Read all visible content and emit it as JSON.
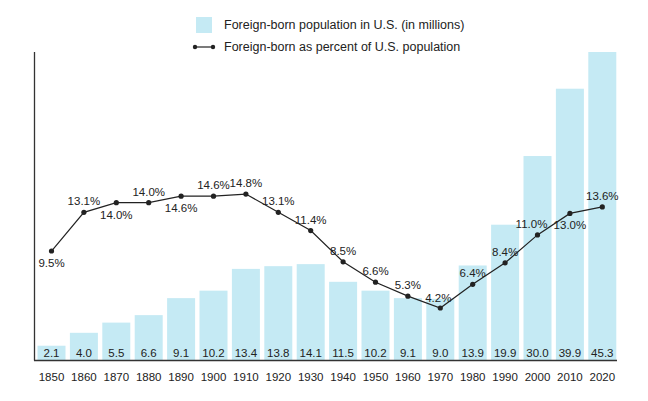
{
  "chart_data": {
    "type": "bar+line",
    "title": "",
    "xlabel": "",
    "ylabel": "",
    "categories": [
      "1850",
      "1860",
      "1870",
      "1880",
      "1890",
      "1900",
      "1910",
      "1920",
      "1930",
      "1940",
      "1950",
      "1960",
      "1970",
      "1980",
      "1990",
      "2000",
      "2010",
      "2020"
    ],
    "series": [
      {
        "name": "Foreign-born population in U.S. (in millions)",
        "type": "bar",
        "color": "#c5eaf4",
        "values": [
          2.1,
          4.0,
          5.5,
          6.6,
          9.1,
          10.2,
          13.4,
          13.8,
          14.1,
          11.5,
          10.2,
          9.1,
          9.0,
          13.9,
          19.9,
          30.0,
          39.9,
          45.3
        ],
        "labels": [
          "2.1",
          "4.0",
          "5.5",
          "6.6",
          "9.1",
          "10.2",
          "13.4",
          "13.8",
          "14.1",
          "11.5",
          "10.2",
          "9.1",
          "9.0",
          "13.9",
          "19.9",
          "30.0",
          "39.9",
          "45.3"
        ]
      },
      {
        "name": "Foreign-born as percent of U.S. population",
        "type": "line",
        "color": "#222222",
        "values": [
          9.5,
          13.1,
          14.0,
          14.0,
          14.6,
          14.6,
          14.8,
          13.1,
          11.4,
          8.5,
          6.6,
          5.3,
          4.2,
          6.4,
          8.4,
          11.0,
          13.0,
          13.6
        ],
        "labels": [
          "9.5%",
          "13.1%",
          "14.0%",
          "14.0%",
          "14.6%",
          "14.6%",
          "14.8%",
          "13.1%",
          "11.4%",
          "8.5%",
          "6.6%",
          "5.3%",
          "4.2%",
          "6.4%",
          "8.4%",
          "11.0%",
          "13.0%",
          "13.6%"
        ],
        "label_positions": [
          "below",
          "above",
          "below",
          "above",
          "below",
          "above",
          "above",
          "above",
          "above",
          "above",
          "above",
          "above",
          "above",
          "above",
          "above",
          "above",
          "below",
          "above"
        ]
      }
    ],
    "legend": {
      "position": "top-center",
      "entries": [
        "Foreign-born population in U.S. (in millions)",
        "Foreign-born as percent of U.S. population"
      ]
    },
    "grid": false,
    "ylim_bars": [
      0,
      45.3
    ],
    "ylim_line": [
      0,
      15
    ]
  },
  "legend": {
    "bar_label": "Foreign-born population in U.S. (in millions)",
    "line_label": "Foreign-born as percent of U.S. population"
  }
}
